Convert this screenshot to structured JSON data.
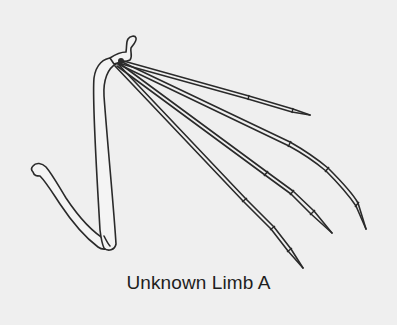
{
  "figure": {
    "caption": "Unknown Limb A",
    "background_color": "#efefef",
    "line_color": "#2a2a2a",
    "parts": [
      {
        "name": "humerus",
        "label": ""
      },
      {
        "name": "radius",
        "label": ""
      },
      {
        "name": "digit-1",
        "label": ""
      },
      {
        "name": "digit-2",
        "label": ""
      },
      {
        "name": "digit-3",
        "label": ""
      },
      {
        "name": "digit-4",
        "label": ""
      }
    ]
  }
}
